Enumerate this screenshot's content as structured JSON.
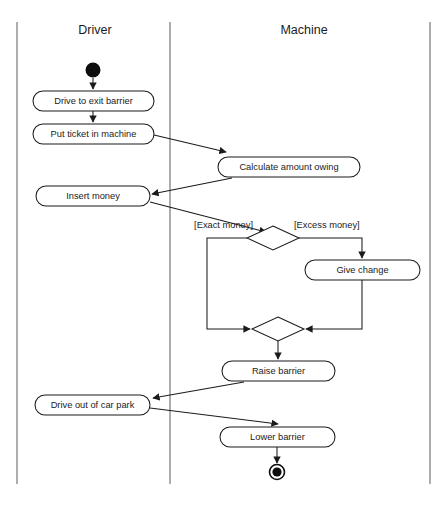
{
  "diagram": {
    "kind": "uml-activity-diagram",
    "title_visible": false,
    "lanes": [
      {
        "id": "driver",
        "label": "Driver",
        "center_x": 95
      },
      {
        "id": "machine",
        "label": "Machine",
        "center_x": 304
      }
    ],
    "lane_lines_x": [
      17,
      170,
      430
    ],
    "lane_line_top": 22,
    "lane_line_bottom": 484,
    "nodes": [
      {
        "id": "initial",
        "type": "initial-node",
        "label": "",
        "lane": "driver",
        "cx": 93,
        "cy": 70,
        "r": 7.5
      },
      {
        "id": "drive-to-exit-barrier",
        "type": "action",
        "label": "Drive to exit barrier",
        "lane": "driver",
        "x": 33,
        "y": 91,
        "w": 121,
        "h": 20
      },
      {
        "id": "put-ticket-in-machine",
        "type": "action",
        "label": "Put ticket in machine",
        "lane": "driver",
        "x": 33,
        "y": 124,
        "w": 121,
        "h": 20
      },
      {
        "id": "calculate-amount-owing",
        "type": "action",
        "label": "Calculate amount owing",
        "lane": "machine",
        "x": 218,
        "y": 157,
        "w": 142,
        "h": 20
      },
      {
        "id": "insert-money",
        "type": "action",
        "label": "Insert money",
        "lane": "driver",
        "x": 36,
        "y": 186,
        "w": 114,
        "h": 20
      },
      {
        "id": "payment-decision",
        "type": "decision",
        "label": "",
        "lane": "machine",
        "cx": 273,
        "cy": 238,
        "w": 52,
        "h": 24
      },
      {
        "id": "give-change",
        "type": "action",
        "label": "Give change",
        "lane": "machine",
        "x": 305,
        "y": 260,
        "w": 115,
        "h": 20
      },
      {
        "id": "payment-merge",
        "type": "merge",
        "label": "",
        "lane": "machine",
        "cx": 278,
        "cy": 329,
        "w": 52,
        "h": 24
      },
      {
        "id": "raise-barrier",
        "type": "action",
        "label": "Raise barrier",
        "lane": "machine",
        "x": 222,
        "y": 361,
        "w": 113,
        "h": 20
      },
      {
        "id": "drive-out-of-car-park",
        "type": "action",
        "label": "Drive out of car park",
        "lane": "driver",
        "x": 35,
        "y": 395,
        "w": 115,
        "h": 20
      },
      {
        "id": "lower-barrier",
        "type": "action",
        "label": "Lower barrier",
        "lane": "machine",
        "x": 220,
        "y": 427,
        "w": 115,
        "h": 20
      },
      {
        "id": "final",
        "type": "final-node",
        "label": "",
        "lane": "machine",
        "cx": 277,
        "cy": 472,
        "r_outer": 7.5,
        "r_inner": 4.6
      }
    ],
    "guards": [
      {
        "id": "guard-exact-money",
        "label": "[Exact money]",
        "x": 253,
        "y": 226,
        "align": "left"
      },
      {
        "id": "guard-excess-money",
        "label": "[Excess money]",
        "x": 294,
        "y": 226,
        "align": "right"
      }
    ],
    "flows": [
      {
        "id": "flow-initial-to-drive",
        "from": "initial",
        "to": "drive-to-exit-barrier",
        "d": "M 93 78 L 93 89"
      },
      {
        "id": "flow-drive-to-put-ticket",
        "from": "drive-to-exit-barrier",
        "to": "put-ticket-in-machine",
        "d": "M 93 111 L 93 122"
      },
      {
        "id": "flow-put-ticket-to-calculate",
        "from": "put-ticket-in-machine",
        "to": "calculate-amount-owing",
        "d": "M 154 135 L 226 152"
      },
      {
        "id": "flow-calculate-to-insert-money",
        "from": "calculate-amount-owing",
        "to": "insert-money",
        "d": "M 232 178 L 152 194"
      },
      {
        "id": "flow-insert-money-to-decision",
        "from": "insert-money",
        "to": "payment-decision",
        "d": "M 150 202 L 266 232"
      },
      {
        "id": "flow-decision-exact-to-merge",
        "from": "payment-decision",
        "to": "payment-merge",
        "d": "M 247 238 L 207 238 L 207 329 L 250 329"
      },
      {
        "id": "flow-decision-excess-to-give-change",
        "from": "payment-decision",
        "to": "give-change",
        "d": "M 299 238 L 362 238 L 362 258"
      },
      {
        "id": "flow-give-change-to-merge",
        "from": "give-change",
        "to": "payment-merge",
        "d": "M 362 280 L 362 329 L 306 329"
      },
      {
        "id": "flow-merge-to-raise-barrier",
        "from": "payment-merge",
        "to": "raise-barrier",
        "d": "M 278 341 L 278 359"
      },
      {
        "id": "flow-raise-barrier-to-drive-out",
        "from": "raise-barrier",
        "to": "drive-out-of-car-park",
        "d": "M 244 382 L 153 398"
      },
      {
        "id": "flow-drive-out-to-lower-barrier",
        "from": "drive-out-of-car-park",
        "to": "lower-barrier",
        "d": "M 150 408 L 278 424"
      },
      {
        "id": "flow-lower-barrier-to-final",
        "from": "lower-barrier",
        "to": "final",
        "d": "M 277 447 L 277 463"
      }
    ],
    "colors": {
      "stroke": "#1b1b1b",
      "lane_line": "#8a8a8a",
      "node_fill": "#ffffff",
      "background": "#ffffff",
      "node_marker": "#0d0d0d"
    }
  }
}
